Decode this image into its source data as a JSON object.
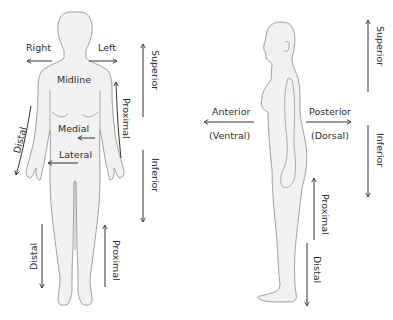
{
  "colors": {
    "body_fill": "#f1f1f1",
    "body_outline": "#8a8a8a",
    "arrow": "#333333",
    "text": "#2f2f2f",
    "background": "#ffffff"
  },
  "front_view": {
    "labels": {
      "right": "Right",
      "left": "Left",
      "midline": "Midline",
      "medial": "Medial",
      "lateral": "Lateral",
      "superior": "Superior",
      "inferior": "Inferior",
      "proximal_arm": "Proximal",
      "distal_arm": "Distal",
      "distal_leg": "Distal",
      "proximal_leg": "Proximal"
    },
    "arrows": [
      {
        "name": "right",
        "direction": "left"
      },
      {
        "name": "left",
        "direction": "right"
      },
      {
        "name": "medial",
        "direction": "left"
      },
      {
        "name": "lateral",
        "direction": "left"
      },
      {
        "name": "superior",
        "direction": "up"
      },
      {
        "name": "inferior",
        "direction": "down"
      },
      {
        "name": "proximal-arm",
        "direction": "up"
      },
      {
        "name": "distal-arm",
        "direction": "down"
      },
      {
        "name": "distal-leg",
        "direction": "down"
      },
      {
        "name": "proximal-leg",
        "direction": "up"
      }
    ]
  },
  "side_view": {
    "labels": {
      "anterior": "Anterior",
      "ventral": "(Ventral)",
      "posterior": "Posterior",
      "dorsal": "(Dorsal)",
      "superior": "Superior",
      "inferior": "Inferior",
      "proximal": "Proximal",
      "distal": "Distal"
    },
    "arrows": [
      {
        "name": "anterior",
        "direction": "left"
      },
      {
        "name": "posterior",
        "direction": "right"
      },
      {
        "name": "superior",
        "direction": "up"
      },
      {
        "name": "inferior",
        "direction": "down"
      },
      {
        "name": "proximal",
        "direction": "up"
      },
      {
        "name": "distal",
        "direction": "down"
      }
    ]
  }
}
